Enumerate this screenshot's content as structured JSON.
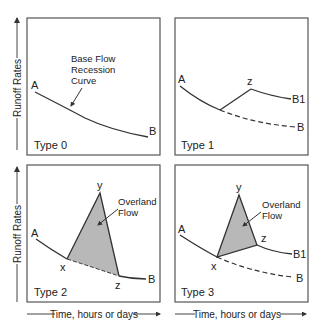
{
  "axes": {
    "ylabel": "Runoff Rates",
    "xlabel": "Time, hours or days"
  },
  "panels": [
    {
      "id": "type0",
      "label": "Type 0",
      "points": {
        "A": "A",
        "B": "B"
      },
      "annotation": [
        "Base Flow",
        "Recession",
        "Curve"
      ]
    },
    {
      "id": "type1",
      "label": "Type 1",
      "points": {
        "A": "A",
        "B": "B",
        "z": "z",
        "B1": "B1"
      }
    },
    {
      "id": "type2",
      "label": "Type 2",
      "points": {
        "A": "A",
        "B": "B",
        "x": "x",
        "y": "y",
        "z": "z"
      },
      "annotation": [
        "Overland",
        "Flow"
      ]
    },
    {
      "id": "type3",
      "label": "Type 3",
      "points": {
        "A": "A",
        "B": "B",
        "B1": "B1",
        "x": "x",
        "y": "y",
        "z": "z"
      },
      "annotation": [
        "Overland",
        "Flow"
      ]
    }
  ],
  "colors": {
    "line": "#333333",
    "frame": "#555555",
    "fill": "#b8b8b8"
  }
}
